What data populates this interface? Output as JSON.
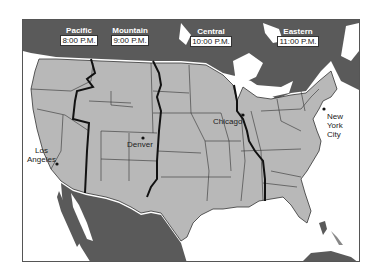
{
  "map": {
    "title": "U.S. Time Zones",
    "colors": {
      "us_land": "#b8b8b8",
      "foreign_land": "#5a5a5a",
      "water": "#ffffff",
      "zone_boundary": "#111111",
      "state_border": "#333333"
    },
    "time_zones": [
      {
        "name": "Pacific",
        "time": "8:00 P.M."
      },
      {
        "name": "Mountain",
        "time": "9:00 P.M."
      },
      {
        "name": "Central",
        "time": "10:00 P.M."
      },
      {
        "name": "Eastern",
        "time": "11:00 P.M."
      }
    ],
    "cities": [
      {
        "name": "Los Angeles",
        "line1": "Los",
        "line2": "Angeles"
      },
      {
        "name": "Denver",
        "line1": "Denver"
      },
      {
        "name": "Chicago",
        "line1": "Chicago"
      },
      {
        "name": "New York City",
        "line1": "New",
        "line2": "York",
        "line3": "City"
      }
    ]
  }
}
